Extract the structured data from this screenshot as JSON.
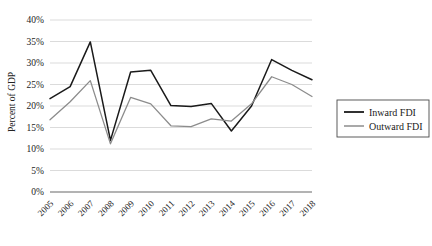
{
  "chart_data": {
    "type": "line",
    "title": "",
    "xlabel": "",
    "ylabel": "Percent of GDP",
    "categories": [
      "2005",
      "2006",
      "2007",
      "2008",
      "2009",
      "2010",
      "2011",
      "2012",
      "2013",
      "2014",
      "2015",
      "2016",
      "2017",
      "2018"
    ],
    "series": [
      {
        "name": "Inward FDI",
        "color": "#1a1a1a",
        "values": [
          21.7,
          24.5,
          34.9,
          12.0,
          27.9,
          28.3,
          20.1,
          19.9,
          20.6,
          14.2,
          20.0,
          30.8,
          28.3,
          26.1
        ]
      },
      {
        "name": "Outward FDI",
        "color": "#8c8c8c",
        "values": [
          16.8,
          21.0,
          25.9,
          11.2,
          22.0,
          20.5,
          15.4,
          15.2,
          17.0,
          16.5,
          20.5,
          26.8,
          25.0,
          22.2
        ]
      }
    ],
    "ylim": [
      0,
      40
    ],
    "y_ticks": [
      "0%",
      "5%",
      "10%",
      "15%",
      "20%",
      "25%",
      "30%",
      "35%",
      "40%"
    ],
    "y_tick_values": [
      0,
      5,
      10,
      15,
      20,
      25,
      30,
      35,
      40
    ],
    "grid": true,
    "legend_position": "right"
  },
  "legend": {
    "items": [
      {
        "label": "Inward FDI",
        "color": "#1a1a1a"
      },
      {
        "label": "Outward FDI",
        "color": "#8c8c8c"
      }
    ]
  },
  "axes": {
    "y_title": "Percent of GDP"
  }
}
